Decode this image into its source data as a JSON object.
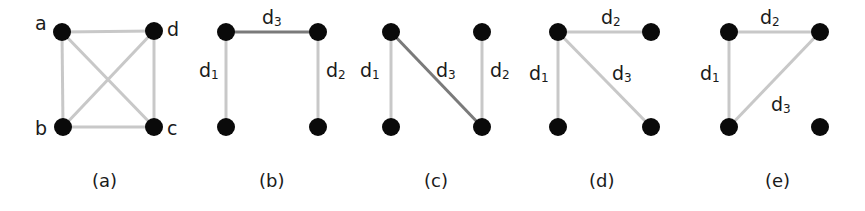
{
  "figure": {
    "panels": [
      {
        "caption": "(a)",
        "nodes": [
          {
            "id": "a",
            "label": "a",
            "x": 62,
            "y": 32
          },
          {
            "id": "d",
            "label": "d",
            "x": 154,
            "y": 31
          },
          {
            "id": "b",
            "label": "b",
            "x": 63,
            "y": 127
          },
          {
            "id": "c",
            "label": "c",
            "x": 154,
            "y": 127
          }
        ],
        "edges": [
          {
            "from": "a",
            "to": "d",
            "style": "light"
          },
          {
            "from": "a",
            "to": "b",
            "style": "light"
          },
          {
            "from": "d",
            "to": "c",
            "style": "light"
          },
          {
            "from": "b",
            "to": "c",
            "style": "light"
          },
          {
            "from": "a",
            "to": "c",
            "style": "light"
          },
          {
            "from": "d",
            "to": "b",
            "style": "light"
          }
        ]
      },
      {
        "caption": "(b)",
        "edges": [
          {
            "label": "d",
            "sub": "3",
            "between": "top-left/top-right",
            "style": "dark"
          },
          {
            "label": "d",
            "sub": "1",
            "between": "top-left/bottom-left",
            "style": "light"
          },
          {
            "label": "d",
            "sub": "2",
            "between": "top-right/bottom-right",
            "style": "light"
          }
        ]
      },
      {
        "caption": "(c)",
        "edges": [
          {
            "label": "d",
            "sub": "1",
            "between": "top-left/bottom-left",
            "style": "light"
          },
          {
            "label": "d",
            "sub": "3",
            "between": "top-left/bottom-right",
            "style": "dark"
          },
          {
            "label": "d",
            "sub": "2",
            "between": "top-right/bottom-right",
            "style": "light"
          }
        ]
      },
      {
        "caption": "(d)",
        "edges": [
          {
            "label": "d",
            "sub": "2",
            "between": "top-left/top-right",
            "style": "light"
          },
          {
            "label": "d",
            "sub": "1",
            "between": "top-left/bottom-left",
            "style": "light"
          },
          {
            "label": "d",
            "sub": "3",
            "between": "top-left/bottom-right",
            "style": "light"
          }
        ]
      },
      {
        "caption": "(e)",
        "edges": [
          {
            "label": "d",
            "sub": "2",
            "between": "top-left/top-right",
            "style": "light"
          },
          {
            "label": "d",
            "sub": "1",
            "between": "top-left/bottom-left",
            "style": "light"
          },
          {
            "label": "d",
            "sub": "3",
            "between": "top-right/bottom-left",
            "style": "light"
          }
        ]
      }
    ],
    "colors": {
      "node": "#0a0a0a",
      "edge_light": "#c8c8c8",
      "edge_dark": "#7a7a7a",
      "text": "#1a1a1a"
    }
  }
}
